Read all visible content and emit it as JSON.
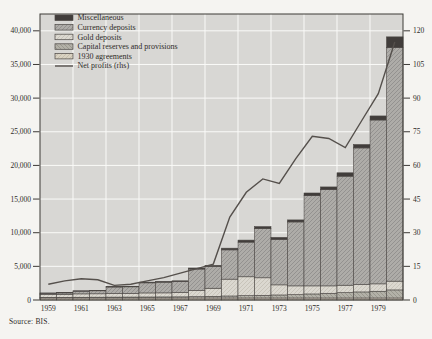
{
  "figure": {
    "source": "Source: BIS.",
    "colors": {
      "page_bg": "#f5f4f1",
      "plot_bg": "#d8d7d4",
      "grid": "#fafaf8",
      "frame": "#3d3a37",
      "bar_outline": "#4b4744",
      "miscellaneous": "#413d3b",
      "currency_base": "#aeaca8",
      "currency_hatch": "#949290",
      "gold_base": "#dbd8d0",
      "gold_hatch": "#c8c4ba",
      "capital_base": "#b3b1a8",
      "capital_hatch": "#9a988e",
      "agreements_base": "#d9d2c2",
      "agreements_hatch": "#c6beac",
      "line": "#55504c",
      "text": "#2e2b28"
    },
    "legend": [
      {
        "label": "Miscellaneous",
        "swatch": "misc"
      },
      {
        "label": "Currency deposits",
        "swatch": "currency"
      },
      {
        "label": "Gold deposits",
        "swatch": "gold"
      },
      {
        "label": "Capital reserves and provisions",
        "swatch": "capital"
      },
      {
        "label": "1930 agreements",
        "swatch": "agreements"
      },
      {
        "label": "Net profits (rhs)",
        "swatch": "line"
      }
    ]
  },
  "chart_data": {
    "type": "bar",
    "subtype": "stacked-bars-with-line-overlay",
    "title": "",
    "xlabel": "",
    "ylabel_left": "",
    "ylabel_right": "",
    "categories": [
      1959,
      1960,
      1961,
      1962,
      1963,
      1964,
      1965,
      1966,
      1967,
      1968,
      1969,
      1970,
      1971,
      1972,
      1973,
      1974,
      1975,
      1976,
      1977,
      1978,
      1979,
      1980
    ],
    "x_tick_labels": [
      "1959",
      "1961",
      "1963",
      "1965",
      "1967",
      "1969",
      "1971",
      "1973",
      "1975",
      "1977",
      "1979"
    ],
    "series": [
      {
        "name": "1930 agreements",
        "values": [
          300,
          300,
          300,
          300,
          300,
          300,
          300,
          300,
          300,
          300,
          300,
          300,
          300,
          300,
          300,
          300,
          300,
          300,
          300,
          300,
          300,
          300
        ]
      },
      {
        "name": "Capital reserves and provisions",
        "values": [
          100,
          100,
          110,
          120,
          130,
          140,
          150,
          160,
          170,
          200,
          250,
          300,
          350,
          400,
          450,
          500,
          600,
          700,
          800,
          900,
          1000,
          1200
        ]
      },
      {
        "name": "Gold deposits",
        "values": [
          450,
          450,
          500,
          500,
          550,
          550,
          600,
          600,
          650,
          900,
          1200,
          2500,
          2800,
          2600,
          1500,
          1300,
          1200,
          1100,
          1100,
          1100,
          1100,
          1300
        ]
      },
      {
        "name": "Currency deposits",
        "values": [
          150,
          200,
          400,
          450,
          950,
          970,
          1500,
          1590,
          1630,
          3200,
          3250,
          4350,
          5150,
          7300,
          6750,
          9500,
          13400,
          14300,
          16200,
          20300,
          24350,
          34700
        ]
      },
      {
        "name": "Miscellaneous",
        "values": [
          50,
          50,
          60,
          60,
          80,
          80,
          100,
          100,
          100,
          150,
          150,
          250,
          300,
          300,
          300,
          300,
          400,
          400,
          500,
          500,
          600,
          1600
        ]
      }
    ],
    "totals": [
      1050,
      1100,
      1370,
      1430,
      2010,
      2040,
      2650,
      2750,
      2850,
      4750,
      5150,
      7700,
      8900,
      10900,
      9300,
      11900,
      15900,
      16800,
      18900,
      23100,
      27350,
      39100
    ],
    "line_series": {
      "name": "Net profits (rhs)",
      "axis": "right",
      "values": [
        7,
        8.5,
        9.5,
        9,
        6.5,
        7,
        8.5,
        10,
        12,
        14,
        16,
        37,
        48,
        54,
        52,
        63,
        73,
        72,
        68,
        80,
        92,
        115
      ]
    },
    "left_axis": {
      "min": 0,
      "max": 42500,
      "tick_step": 5000,
      "tick_max": 40000
    },
    "right_axis": {
      "min": 0,
      "max": 127.5,
      "tick_step": 15,
      "tick_max": 120
    },
    "grid": true,
    "legend_position": "top-left"
  }
}
